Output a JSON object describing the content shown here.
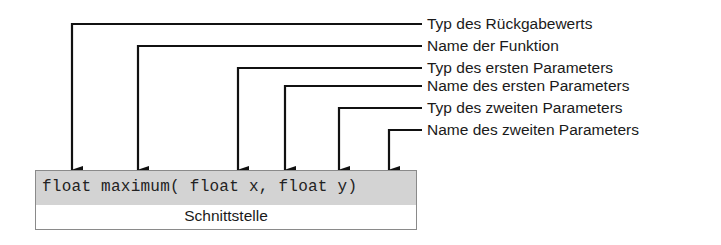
{
  "diagram": {
    "signature": "float maximum( float x, float y)",
    "caption": "Schnittstelle",
    "annotations": [
      {
        "label": "Typ des Rückgabewerts",
        "target": "float",
        "arrow_x": 72,
        "line_y": 24
      },
      {
        "label": "Name der Funktion",
        "target": "maximum",
        "arrow_x": 138,
        "line_y": 46
      },
      {
        "label": "Typ des ersten Parameters",
        "target": "float",
        "arrow_x": 238,
        "line_y": 68
      },
      {
        "label": "Name des ersten Parameters",
        "target": "x",
        "arrow_x": 285,
        "line_y": 86
      },
      {
        "label": "Typ des zweiten Parameters",
        "target": "float",
        "arrow_x": 339,
        "line_y": 108
      },
      {
        "label": "Name des zweiten Parameters",
        "target": "y",
        "arrow_x": 389,
        "line_y": 130
      }
    ],
    "colors": {
      "line": "#111111",
      "code_band": "#d3d3d3",
      "box_border": "#8a8a8a"
    }
  }
}
